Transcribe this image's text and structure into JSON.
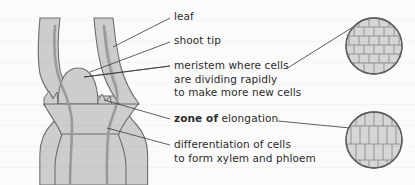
{
  "figure": {
    "background_color": "#fbfbfb",
    "ink_color": "#2b2b2b",
    "tissue_fill": "#cdcdcd",
    "tissue_outline": "#6e6e6e",
    "vascular_color": "#9a9a9a",
    "inset_fill": "#d2d2d2",
    "inset_outline": "#5f5f5f",
    "cell_wall_color": "#8c8c8c"
  },
  "labels": [
    {
      "id": "leaf",
      "lines": [
        {
          "text": "leaf",
          "bold": false
        }
      ],
      "x": 174,
      "y": 16
    },
    {
      "id": "shoot-tip",
      "lines": [
        {
          "text": "shoot tip",
          "bold": false
        }
      ],
      "x": 174,
      "y": 40
    },
    {
      "id": "meristem",
      "lines": [
        {
          "text": "meristem where cells",
          "bold": false
        },
        {
          "text": "are dividing rapidly",
          "bold": false
        },
        {
          "text": "to make more new cells",
          "bold": false
        }
      ],
      "x": 174,
      "y": 64
    },
    {
      "id": "zone-of-elongation",
      "lines": [
        {
          "text": "zone of ",
          "bold": true,
          "tail": "elongation",
          "tail_bold": false
        }
      ],
      "x": 174,
      "y": 116
    },
    {
      "id": "differentiation",
      "lines": [
        {
          "text": "differentiation of cells",
          "bold": false
        },
        {
          "text": "to form xylem and phloem",
          "bold": false
        }
      ],
      "x": 174,
      "y": 143
    }
  ],
  "label_text": {
    "leaf": "leaf",
    "shoot_tip": "shoot tip",
    "meristem_line1": "meristem where cells",
    "meristem_line2": "are dividing rapidly",
    "meristem_line3": "to make more new cells",
    "elongation_bold": "zone of",
    "elongation_rest": "elongation",
    "differentiation_line1": "differentiation of cells",
    "differentiation_line2": "to form xylem and phloem"
  },
  "insets": [
    {
      "id": "meristem-cells-inset",
      "description": "small isodiametric dividing cells, brick pattern",
      "center_x": 374,
      "center_y": 46,
      "radius": 28,
      "rows": 6,
      "cols": 6,
      "cell_shape": "square"
    },
    {
      "id": "elongated-cells-inset",
      "description": "elongated vacuolated cells, tall rectangles",
      "center_x": 374,
      "center_y": 140,
      "radius": 28,
      "rows": 3,
      "cols": 6,
      "cell_shape": "elongated"
    }
  ],
  "leader_lines": [
    {
      "id": "leader-leaf",
      "from_x": 113,
      "from_y": 47,
      "to_x": 170,
      "to_y": 18
    },
    {
      "id": "leader-shoot-tip",
      "from_x": 90,
      "from_y": 72,
      "to_x": 170,
      "to_y": 42
    },
    {
      "id": "leader-meristem",
      "from_x": 85,
      "from_y": 76,
      "to_x": 170,
      "to_y": 66
    },
    {
      "id": "leader-elongation",
      "from_x": 103,
      "from_y": 99,
      "to_x": 170,
      "to_y": 119
    },
    {
      "id": "leader-differentiation",
      "from_x": 106,
      "from_y": 128,
      "to_x": 170,
      "to_y": 145
    },
    {
      "id": "connector-meristem-inset",
      "from_x": 285,
      "from_y": 68,
      "to_x": 352,
      "to_y": 28
    },
    {
      "id": "connector-elongation-inset",
      "from_x": 278,
      "from_y": 120,
      "to_x": 350,
      "to_y": 128
    }
  ]
}
